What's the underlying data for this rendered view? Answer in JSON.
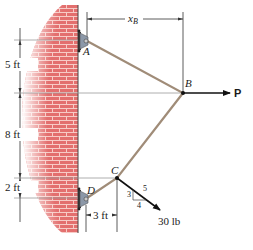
{
  "figure": {
    "type": "statics-cable-diagram",
    "points": {
      "A": {
        "label": "A"
      },
      "B": {
        "label": "B"
      },
      "C": {
        "label": "C"
      },
      "D": {
        "label": "D"
      }
    },
    "dimensions": {
      "vertical_AB": "5 ft",
      "vertical_BC": "8 ft",
      "vertical_CD": "2 ft",
      "horizontal_DC": "3 ft",
      "horizontal_xB": {
        "var": "x",
        "sub": "B"
      }
    },
    "loads": {
      "P": {
        "label": "P",
        "direction": "right"
      },
      "C_force": {
        "label": "30 lb",
        "slope": {
          "rise": "3",
          "run": "4",
          "hyp": "5"
        }
      }
    },
    "colors": {
      "brick": "#e0686a",
      "mortar": "#f6c9c4",
      "cable": "#9c8a78",
      "support": "#8c98a8",
      "line": "#333333"
    }
  }
}
